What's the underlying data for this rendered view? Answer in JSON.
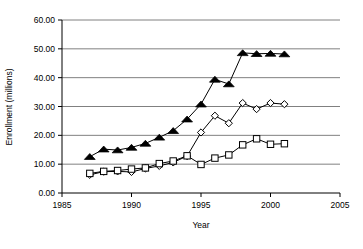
{
  "chart_data": {
    "type": "line",
    "title": "",
    "xlabel": "Year",
    "ylabel": "Enrollment (millions)",
    "xlim": [
      1985,
      2005
    ],
    "ylim": [
      0,
      60
    ],
    "x_ticks": [
      "1985",
      "1990",
      "1995",
      "2000",
      "2005"
    ],
    "x_tick_values": [
      1985,
      1990,
      1995,
      2000,
      2005
    ],
    "y_ticks": [
      "0.00",
      "10.00",
      "20.00",
      "30.00",
      "40.00",
      "50.00",
      "60.00"
    ],
    "y_tick_values": [
      0,
      10,
      20,
      30,
      40,
      50,
      60
    ],
    "grid": "horizontal",
    "legend": "none",
    "x": [
      1987,
      1988,
      1989,
      1990,
      1991,
      1992,
      1993,
      1994,
      1995,
      1996,
      1997,
      1998,
      1999,
      2000,
      2001
    ],
    "series": [
      {
        "name": "series-triangle",
        "marker": "filled-triangle",
        "color": "#000000",
        "values": [
          12.6,
          15.2,
          14.9,
          15.8,
          17.2,
          19.3,
          21.6,
          25.6,
          30.8,
          39.4,
          37.8,
          48.6,
          48.3,
          48.4,
          48.2
        ]
      },
      {
        "name": "series-diamond",
        "marker": "open-diamond",
        "color": "#000000",
        "values": [
          6.3,
          7.4,
          7.5,
          7.3,
          8.5,
          9.4,
          10.6,
          12.8,
          21.0,
          26.8,
          24.2,
          31.2,
          29.1,
          31.2,
          30.8
        ]
      },
      {
        "name": "series-square",
        "marker": "open-square",
        "color": "#000000",
        "values": [
          6.8,
          7.5,
          7.8,
          8.3,
          8.7,
          10.2,
          11.1,
          12.9,
          9.9,
          12.1,
          13.2,
          16.7,
          18.8,
          16.9,
          17.1
        ]
      }
    ]
  },
  "axes": {
    "y_title": "Enrollment (millions)",
    "x_title": "Year"
  }
}
